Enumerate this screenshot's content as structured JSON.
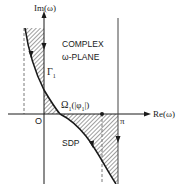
{
  "diagram": {
    "title_line1": "COMPLEX",
    "title_line2": "ω-PLANE",
    "axes": {
      "imag_label": "Im(ω)",
      "real_label": "Re(ω)",
      "origin_label": "O",
      "pi_label": "π"
    },
    "contours": {
      "gamma_label": "Γ",
      "gamma_subscript": "1",
      "omega_label": "Ω",
      "omega_subscript": "1",
      "omega_arg": "(|φ",
      "omega_arg_sub": "1",
      "omega_arg_end": "|)",
      "sdp_label": "SDP"
    },
    "colors": {
      "line": "#1a1a1a",
      "dashed": "#7a7a7a",
      "hatch": "#2a2a2a",
      "background": "#ffffff"
    }
  }
}
